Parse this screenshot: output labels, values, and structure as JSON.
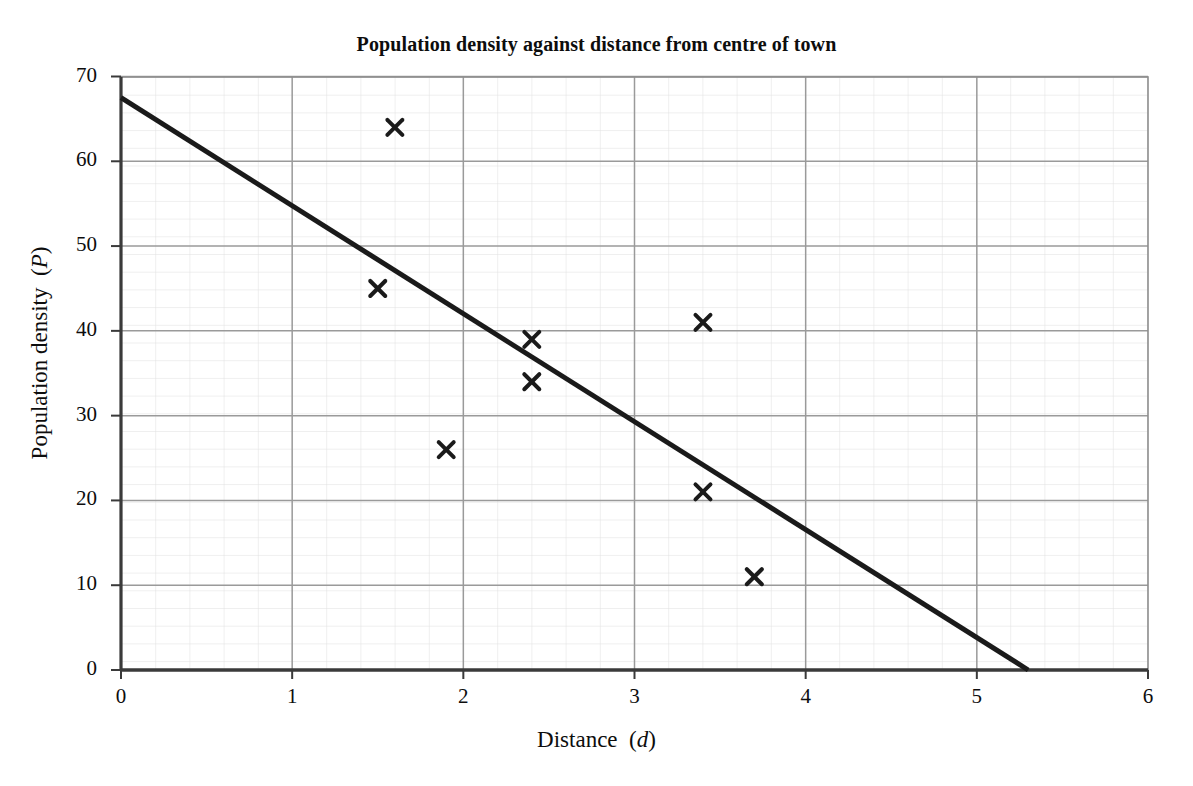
{
  "chart_data": {
    "type": "scatter",
    "title": "Population density against distance from centre of town",
    "xlabel": "Distance (d)",
    "xlabel_plain": "Distance",
    "xlabel_variable": "d",
    "ylabel": "Population density (P)",
    "ylabel_plain": "Population density",
    "ylabel_variable": "P",
    "xlim": [
      0,
      6
    ],
    "ylim": [
      0,
      70
    ],
    "x_ticks": [
      "0",
      "1",
      "2",
      "3",
      "4",
      "5",
      "6"
    ],
    "y_ticks": [
      "0",
      "10",
      "20",
      "30",
      "40",
      "50",
      "60",
      "70"
    ],
    "x_tick_values": [
      0,
      1,
      2,
      3,
      4,
      5,
      6
    ],
    "y_tick_values": [
      0,
      10,
      20,
      30,
      40,
      50,
      60,
      70
    ],
    "x_minor_step": 0.2,
    "y_minor_step": 2,
    "grid": true,
    "grid_major_color": "#9a9a9a",
    "grid_minor_color": "#dcdcdc",
    "axis_color": "#3a3a3a",
    "legend": "none",
    "marker_symbol": "x",
    "marker_color": "#1a1a1a",
    "points": [
      {
        "d": 1.5,
        "P": 45
      },
      {
        "d": 1.6,
        "P": 64
      },
      {
        "d": 1.9,
        "P": 26
      },
      {
        "d": 2.4,
        "P": 39
      },
      {
        "d": 2.4,
        "P": 34
      },
      {
        "d": 3.4,
        "P": 41
      },
      {
        "d": 3.4,
        "P": 21
      },
      {
        "d": 3.7,
        "P": 11
      }
    ],
    "series": [
      {
        "name": "Population density observations",
        "x": [
          1.5,
          1.6,
          1.9,
          2.4,
          2.4,
          3.4,
          3.4,
          3.7
        ],
        "values": [
          45,
          64,
          26,
          39,
          34,
          41,
          21,
          11
        ]
      }
    ],
    "trend_line": {
      "name": "Line of best fit",
      "color": "#1a1a1a",
      "width": 5,
      "start": {
        "d": 0,
        "P": 67.5
      },
      "end": {
        "d": 5.3,
        "P": 0
      },
      "intercept": 67.5,
      "slope": -12.74
    }
  }
}
